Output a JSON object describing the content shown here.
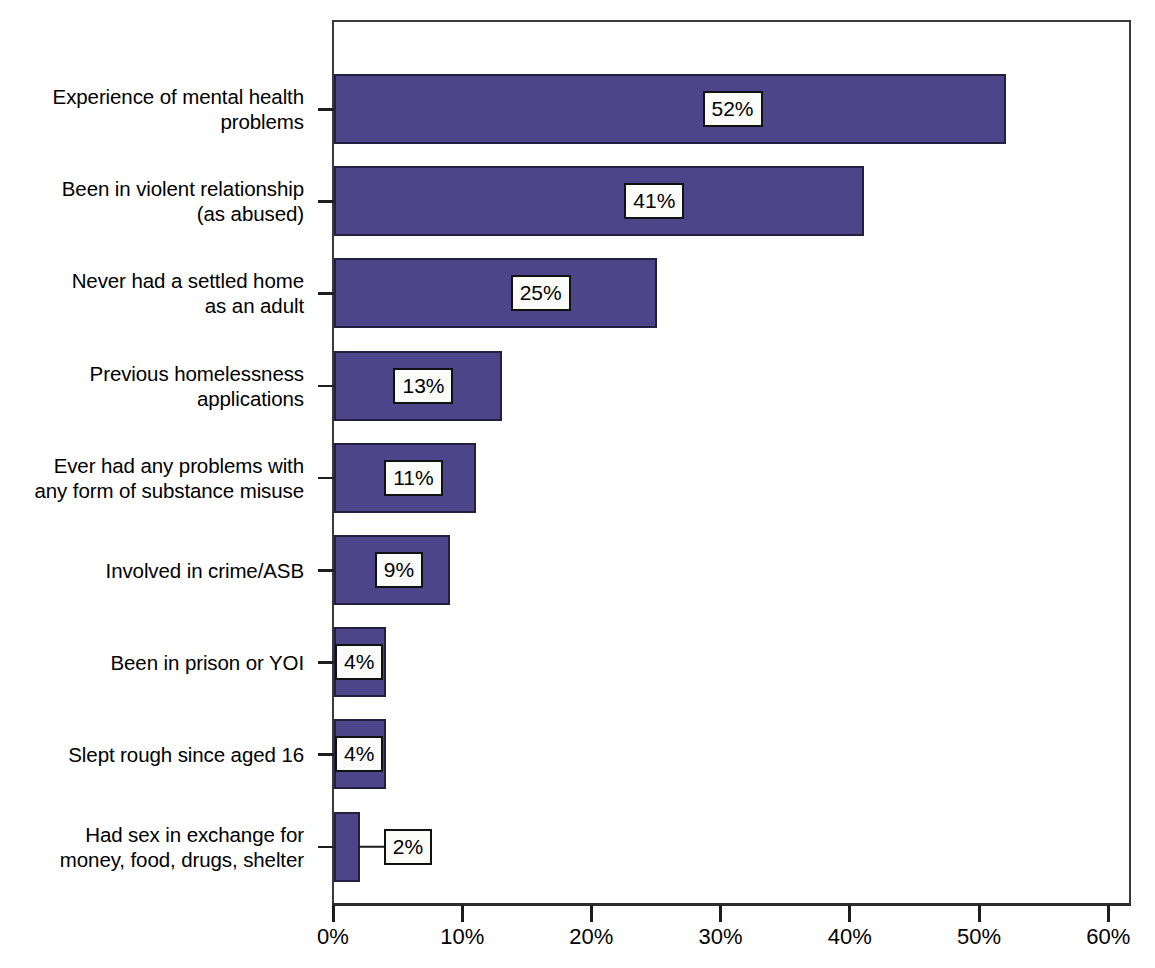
{
  "chart_data": {
    "type": "bar",
    "orientation": "horizontal",
    "title": "",
    "subtitle": "",
    "xlabel": "",
    "ylabel": "",
    "xlim": [
      0,
      61.8
    ],
    "grid": false,
    "legend": false,
    "bar_color": "#4d4489",
    "bar_edge_color": "#23203f",
    "label_box_fill": "#fbfbf9",
    "label_box_border": "#111111",
    "categories": [
      "Experience of mental health\nproblems",
      "Been in violent relationship\n(as abused)",
      "Never had a settled home\nas an adult",
      "Previous homelessness\napplications",
      "Ever had any problems with\nany form of substance misuse",
      "Involved in crime/ASB",
      "Been in prison or YOI",
      "Slept rough since aged 16",
      "Had sex in exchange for\nmoney, food, drugs, shelter"
    ],
    "values": [
      52,
      41,
      25,
      13,
      11,
      9,
      4,
      4,
      2
    ],
    "value_labels": [
      "52%",
      "41%",
      "25%",
      "13%",
      "11%",
      "9%",
      "4%",
      "4%",
      "2%"
    ],
    "xticks": [
      0,
      10,
      20,
      30,
      40,
      50,
      60
    ],
    "xtick_labels": [
      "0%",
      "10%",
      "20%",
      "30%",
      "40%",
      "50%",
      "60%"
    ]
  }
}
